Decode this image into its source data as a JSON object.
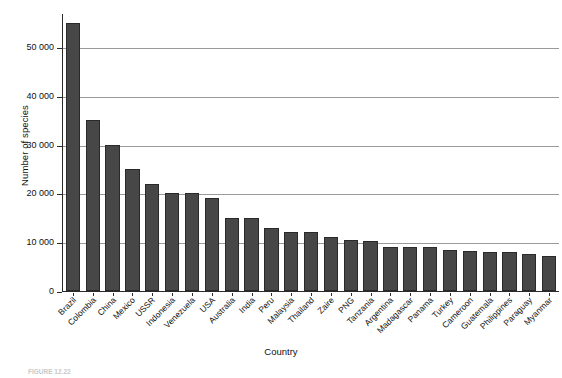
{
  "chart_data": {
    "type": "bar",
    "title": "",
    "xlabel": "Country",
    "ylabel": "Number of species",
    "ylim": [
      0,
      57000
    ],
    "grid": true,
    "legend": "none",
    "yticks": [
      0,
      10000,
      20000,
      30000,
      40000,
      50000
    ],
    "ytick_labels": [
      "0",
      "10 000",
      "20 000",
      "30 000",
      "40 000",
      "50 000"
    ],
    "bar_color": "#474747",
    "bar_edge_color": "#2a2a2a",
    "grid_color": "#9a9a9a",
    "categories": [
      "Brazil",
      "Colombia",
      "China",
      "Mexico",
      "USSR",
      "Indonesia",
      "Venezuela",
      "USA",
      "Australia",
      "India",
      "Peru",
      "Malaysia",
      "Thailand",
      "Zaire",
      "PNG",
      "Tanzania",
      "Argentina",
      "Madagascar",
      "Panama",
      "Turkey",
      "Cameroon",
      "Guatemala",
      "Philippines",
      "Paraguay",
      "Myanmar"
    ],
    "values": [
      55000,
      35000,
      30000,
      25000,
      22000,
      20000,
      20000,
      19000,
      15000,
      15000,
      13000,
      12000,
      12000,
      11000,
      10500,
      10200,
      9000,
      9000,
      9000,
      8500,
      8200,
      8100,
      8000,
      7500,
      7200
    ]
  },
  "caption": {
    "figure_number": "FIGURE 12.22",
    "text": ""
  }
}
